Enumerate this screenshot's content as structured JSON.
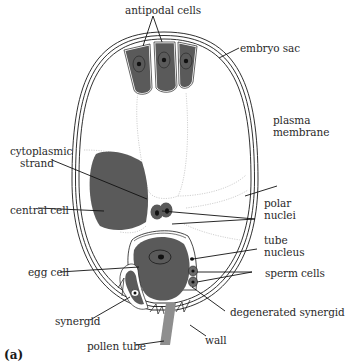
{
  "figure": {
    "panel_label": "(a)",
    "colors": {
      "cell_fill": "#5a5a5a",
      "nucleus_fill": "#111111",
      "wall_stroke": "#1a1a1a",
      "cytoplasm_line": "#bfbfbf",
      "pollen_tube": "#8e8e8e",
      "background": "#ffffff"
    }
  },
  "labels": {
    "antipodal_cells": "antipodal cells",
    "embryo_sac": "embryo sac",
    "plasma_membrane_1": "plasma",
    "plasma_membrane_2": "membrane",
    "cytoplasmic_strand_1": "cytoplasmic",
    "cytoplasmic_strand_2": "strand",
    "central_cell": "central cell",
    "polar_nuclei_1": "polar",
    "polar_nuclei_2": "nuclei",
    "tube_nucleus_1": "tube",
    "tube_nucleus_2": "nucleus",
    "egg_cell": "egg cell",
    "sperm_cells": "sperm cells",
    "synergid": "synergid",
    "degenerated_synergid": "degenerated synergid",
    "pollen_tube": "pollen tube",
    "wall": "wall"
  }
}
